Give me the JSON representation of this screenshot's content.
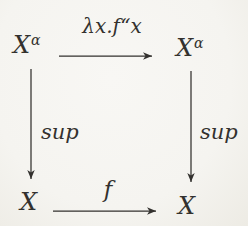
{
  "figure": {
    "background": "#f5f4f0",
    "ink": "#33312e",
    "nodes": {
      "top_left": {
        "base": "X",
        "sup": "α"
      },
      "top_right": {
        "base": "X",
        "sup": "α"
      },
      "bottom_left": {
        "base": "X"
      },
      "bottom_right": {
        "base": "X"
      }
    },
    "arrows": {
      "top": {
        "label": "λx.f“x",
        "direction": "right"
      },
      "bottom": {
        "label": "f",
        "direction": "right"
      },
      "left": {
        "label": "sup",
        "direction": "down"
      },
      "right": {
        "label": "sup",
        "direction": "down"
      }
    }
  }
}
